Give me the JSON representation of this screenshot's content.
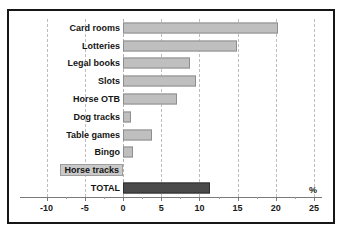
{
  "chart_data": {
    "type": "bar",
    "orientation": "horizontal",
    "title": "",
    "subtitle": "",
    "xlabel": "%",
    "ylabel": "",
    "xlim": [
      -10,
      25
    ],
    "xticks": [
      -10,
      -5,
      0,
      5,
      10,
      15,
      20,
      25
    ],
    "xticklabels": [
      "-10",
      "-5",
      "0",
      "5",
      "10",
      "15",
      "20",
      "25"
    ],
    "grid": true,
    "grid_axis": "x",
    "grid_style": "dashed",
    "legend": false,
    "categories": [
      "Card rooms",
      "Lotteries",
      "Legal books",
      "Slots",
      "Horse OTB",
      "Dog tracks",
      "Table games",
      "Bingo",
      "Horse tracks",
      "TOTAL"
    ],
    "values": [
      20.3,
      14.9,
      8.8,
      9.6,
      7.1,
      1.0,
      3.8,
      1.3,
      0.0,
      11.4
    ],
    "highlight_category": "TOTAL",
    "colors": {
      "bar_fill": "#bfbfbf",
      "bar_edge": "#8e8e8e",
      "total_fill": "#4a4a4a",
      "total_edge": "#2e2e2e",
      "grid": "#bdbdbd",
      "axis": "#7a7a7a",
      "frame": "#161616",
      "background": "#ffffff",
      "text": "#141414"
    }
  }
}
